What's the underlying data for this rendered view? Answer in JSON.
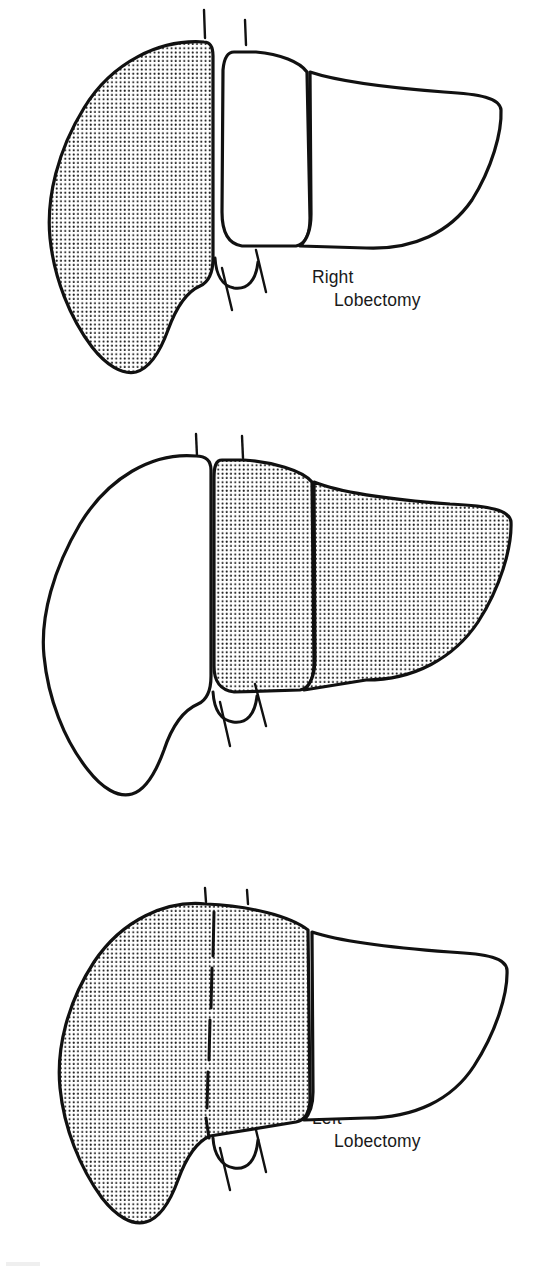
{
  "figure": {
    "background_color": "#ffffff",
    "ink_color": "#111111",
    "stipple_color": "#1a1a1a",
    "panels": [
      {
        "id": "right-lobectomy",
        "caption_line1": "Right",
        "caption_line2": "Lobectomy",
        "shaded_region": "right lobe",
        "unshaded_region": "left medial segment and left lateral segment",
        "has_dashed_plane": false
      },
      {
        "id": "left-lobectomy",
        "caption_line1": "Left",
        "caption_line2": "Lobectomy",
        "shaded_region": "left medial segment and left lateral segment",
        "unshaded_region": "right lobe",
        "has_dashed_plane": false
      },
      {
        "id": "trisegmentectomy",
        "caption_line1": "Trisegmentectomy",
        "caption_line2": "",
        "shaded_region": "right lobe and left medial segment",
        "unshaded_region": "left lateral segment",
        "has_dashed_plane": true
      }
    ],
    "anatomy_parts": [
      "right-lobe",
      "left-medial-segment",
      "left-lateral-segment",
      "gallbladder",
      "vessel-stub-superior-left",
      "vessel-stub-superior-right",
      "vessel-stub-inferior-left",
      "vessel-stub-inferior-right",
      "interlobar-plane-dashed-line"
    ]
  }
}
